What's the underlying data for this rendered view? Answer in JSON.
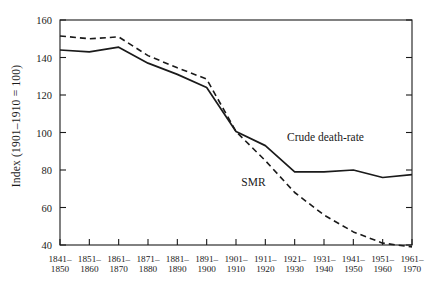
{
  "chart_data": {
    "type": "line",
    "title": "",
    "xlabel": "",
    "ylabel": "Index (1901–1910 = 100)",
    "ylim": [
      30,
      163
    ],
    "yticks": [
      40,
      60,
      80,
      100,
      120,
      140,
      160
    ],
    "ytick_labels": [
      "40",
      "60",
      "80",
      "100",
      "120",
      "140",
      "160"
    ],
    "grid": false,
    "legend_position": "inline-annotation",
    "categories": [
      "1841–1850",
      "1851–1860",
      "1861–1870",
      "1871–1880",
      "1881–1890",
      "1891–1900",
      "1901–1910",
      "1911–1920",
      "1921–1930",
      "1931–1940",
      "1941–1950",
      "1951–1960",
      "1961–1970"
    ],
    "xtick_labels": [
      [
        "1841–",
        "1850"
      ],
      [
        "1851–",
        "1860"
      ],
      [
        "1861–",
        "1870"
      ],
      [
        "1871–",
        "1880"
      ],
      [
        "1881–",
        "1890"
      ],
      [
        "1891–",
        "1900"
      ],
      [
        "1901–",
        "1910"
      ],
      [
        "1911–",
        "1920"
      ],
      [
        "1921–",
        "1930"
      ],
      [
        "1931–",
        "1940"
      ],
      [
        "1941–",
        "1950"
      ],
      [
        "1951–",
        "1960"
      ],
      [
        "1961–",
        "1970"
      ]
    ],
    "series": [
      {
        "name": "Crude death-rate",
        "style": "solid",
        "color": "#1a1a1a",
        "values": [
          144,
          143,
          145.5,
          137,
          131,
          124,
          100.5,
          93,
          79,
          79,
          80,
          76,
          77.5
        ]
      },
      {
        "name": "SMR",
        "style": "dashed",
        "color": "#1a1a1a",
        "values": [
          151.5,
          150,
          151,
          141,
          134.5,
          128.5,
          100.5,
          85,
          68,
          56,
          47,
          41,
          39
        ]
      }
    ],
    "annotations": [
      {
        "text": "Crude death-rate",
        "x": 0.645,
        "y": 0.495
      },
      {
        "text": "SMR",
        "x": 0.515,
        "y": 0.695
      }
    ]
  },
  "axis_style": {
    "frame_color": "#1a1a1a",
    "tick_color": "#1a1a1a",
    "background": "#ffffff"
  }
}
